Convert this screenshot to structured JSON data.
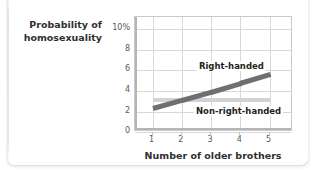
{
  "chart_data": {
    "type": "line",
    "title": "",
    "subtitle": "",
    "xlabel": "Number of older brothers",
    "ylabel": "Probability of homosexuality",
    "ylabel_line1": "Probability of",
    "ylabel_line2": "homosexuality",
    "x": [
      1,
      2,
      3,
      4,
      5
    ],
    "xticklabels": [
      "1",
      "2",
      "3",
      "4",
      "5"
    ],
    "yticklabels": [
      "0",
      "2",
      "4",
      "6",
      "8",
      "10%"
    ],
    "yticks": [
      0,
      2,
      4,
      6,
      8,
      10
    ],
    "xlim": [
      0.4,
      5.8
    ],
    "ylim": [
      0,
      11.2
    ],
    "grid": "both",
    "legend_position": "inline-annotations",
    "yunit": "%",
    "series": [
      {
        "name": "Right-handed",
        "style": "band",
        "color": "#6f6f71",
        "values": [
          2.25,
          3.05,
          3.85,
          4.7,
          5.55
        ],
        "band_low": [
          2.0,
          2.8,
          3.6,
          4.45,
          5.3
        ],
        "band_high": [
          2.5,
          3.3,
          4.1,
          4.95,
          5.8
        ],
        "annotation": "Right-handed"
      },
      {
        "name": "Non-right-handed",
        "style": "band",
        "color": "#d2d2d2",
        "values": [
          3.15,
          3.15,
          3.15,
          3.15,
          3.15
        ],
        "band_low": [
          2.95,
          2.95,
          2.95,
          2.95,
          2.95
        ],
        "band_high": [
          3.35,
          3.35,
          3.35,
          3.35,
          3.35
        ],
        "annotation": "Non-right-handed"
      }
    ]
  },
  "colors": {
    "right_handed_band": "#6f6f71",
    "non_right_handed_band": "#d2d2d2",
    "grid": "#d8d8d8",
    "axis": "#b5b5b5",
    "tick_text": "#58585a",
    "title_text": "#2f2f31",
    "background": "#ffffff"
  }
}
